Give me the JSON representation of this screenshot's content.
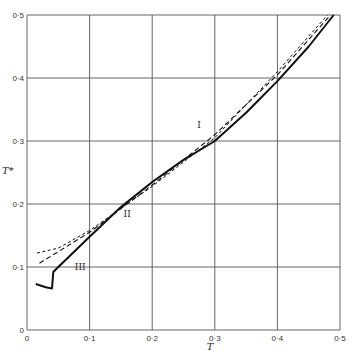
{
  "chart_data": {
    "type": "line",
    "title": "",
    "xlabel": "T",
    "ylabel": "T*",
    "xlim": [
      0,
      0.5
    ],
    "ylim": [
      0,
      0.5
    ],
    "grid": true,
    "xticks": [
      "0",
      "0·1",
      "0·2",
      "0·3",
      "0·4",
      "0·5"
    ],
    "yticks": [
      "0",
      "0·1",
      "0·2",
      "0·3",
      "0·4",
      "0·5"
    ],
    "xtick_values": [
      0,
      0.1,
      0.2,
      0.3,
      0.4,
      0.5
    ],
    "ytick_values": [
      0,
      0.1,
      0.2,
      0.3,
      0.4,
      0.5
    ],
    "legend": "none",
    "annotations": [
      {
        "text": "I",
        "x": 0.275,
        "y": 0.32
      },
      {
        "text": "II",
        "x": 0.16,
        "y": 0.18
      },
      {
        "text": "III",
        "x": 0.085,
        "y": 0.095
      }
    ],
    "series": [
      {
        "name": "III (solid)",
        "style": "solid",
        "x": [
          0.014,
          0.03,
          0.04,
          0.042,
          0.05,
          0.1,
          0.15,
          0.2,
          0.25,
          0.3,
          0.35,
          0.4,
          0.45,
          0.49
        ],
        "y": [
          0.073,
          0.068,
          0.066,
          0.092,
          0.1,
          0.148,
          0.195,
          0.235,
          0.27,
          0.3,
          0.345,
          0.395,
          0.45,
          0.5
        ]
      },
      {
        "name": "I (long dash)",
        "style": "long-dash",
        "x": [
          0.02,
          0.1,
          0.2,
          0.3,
          0.4,
          0.485
        ],
        "y": [
          0.106,
          0.155,
          0.23,
          0.31,
          0.405,
          0.5
        ]
      },
      {
        "name": "II (short dash)",
        "style": "short-dash",
        "x": [
          0.016,
          0.05,
          0.1,
          0.2,
          0.3,
          0.4,
          0.48
        ],
        "y": [
          0.122,
          0.13,
          0.158,
          0.228,
          0.305,
          0.41,
          0.5
        ]
      }
    ]
  }
}
